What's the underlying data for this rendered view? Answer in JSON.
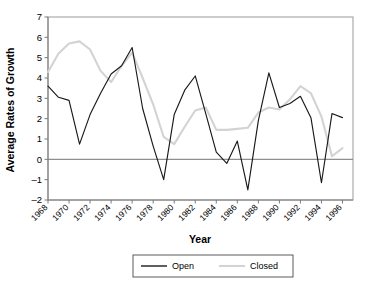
{
  "chart_data": {
    "type": "line",
    "title": "",
    "xlabel": "Year",
    "ylabel": "Average Rates of Growth",
    "xlim": [
      1968,
      1997
    ],
    "ylim": [
      -2,
      7
    ],
    "yticks": [
      -2,
      -1,
      0,
      1,
      2,
      3,
      4,
      5,
      6,
      7
    ],
    "ytick_labels": [
      "-2",
      "-1",
      "0",
      "1",
      "2",
      "3",
      "4",
      "5",
      "6",
      "7"
    ],
    "xticks": [
      1968,
      1970,
      1972,
      1974,
      1976,
      1978,
      1980,
      1982,
      1984,
      1986,
      1988,
      1990,
      1992,
      1994,
      1996
    ],
    "xtick_labels": [
      "1968",
      "1970",
      "1972",
      "1974",
      "1976",
      "1978",
      "1980",
      "1982",
      "1984",
      "1986",
      "1988",
      "1990",
      "1992",
      "1994",
      "1996"
    ],
    "grid": false,
    "zero_line": true,
    "legend_position": "bottom",
    "x": [
      1968,
      1969,
      1970,
      1971,
      1972,
      1973,
      1974,
      1975,
      1976,
      1977,
      1978,
      1979,
      1980,
      1981,
      1982,
      1983,
      1984,
      1985,
      1986,
      1987,
      1988,
      1989,
      1990,
      1991,
      1992,
      1993,
      1994,
      1995,
      1996
    ],
    "series": [
      {
        "name": "Open",
        "color": "#1a1a1a",
        "values": [
          3.6,
          3.05,
          2.9,
          0.75,
          2.2,
          3.25,
          4.2,
          4.6,
          5.5,
          2.5,
          0.65,
          -1.0,
          2.2,
          3.4,
          4.1,
          2.25,
          0.35,
          -0.2,
          0.9,
          -1.5,
          1.9,
          4.25,
          2.55,
          2.75,
          3.1,
          2.05,
          -1.15,
          2.25,
          2.05
        ]
      },
      {
        "name": "Closed",
        "color": "#d3d3d3",
        "values": [
          4.3,
          5.2,
          5.7,
          5.8,
          5.4,
          4.35,
          3.8,
          4.6,
          5.25,
          4.0,
          2.7,
          1.1,
          0.75,
          1.6,
          2.4,
          2.55,
          1.45,
          1.45,
          1.5,
          1.55,
          2.3,
          2.55,
          2.45,
          2.95,
          3.6,
          3.25,
          2.1,
          0.15,
          0.55
        ]
      }
    ]
  },
  "legend": {
    "items": [
      {
        "label": "Open",
        "color": "#1a1a1a"
      },
      {
        "label": "Closed",
        "color": "#d3d3d3"
      }
    ]
  },
  "axes": {
    "x_title": "Year",
    "y_title": "Average Rates of Growth"
  }
}
